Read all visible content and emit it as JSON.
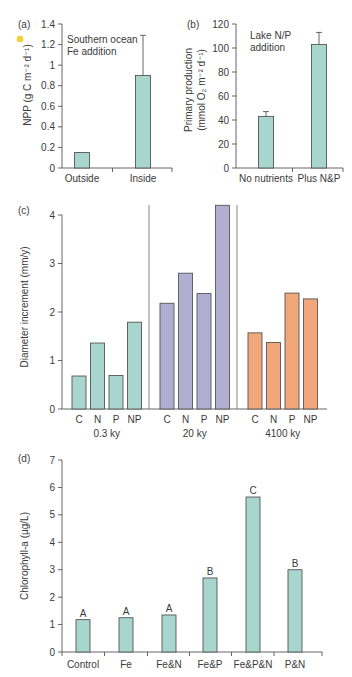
{
  "chart_data": [
    {
      "panel": "(a)",
      "type": "bar",
      "annotation": [
        "Southern ocean",
        "Fe addition"
      ],
      "ylabel": "NPP (g C m⁻² d⁻¹)",
      "xlabel": "",
      "ylim": [
        0,
        1.4
      ],
      "yticks": [
        0,
        0.2,
        0.4,
        0.6,
        0.8,
        1,
        1.2,
        1.4
      ],
      "ytick_labels": [
        "0",
        "0.2",
        "0.4",
        "0.6",
        "0.8",
        "1",
        "1.2",
        "1.4"
      ],
      "categories": [
        "Outside",
        "Inside"
      ],
      "values": [
        0.15,
        0.9
      ],
      "error_upper": [
        null,
        1.29
      ],
      "color": "#a8d5ce"
    },
    {
      "panel": "(b)",
      "type": "bar",
      "annotation": [
        "Lake N/P",
        "addition"
      ],
      "ylabel": [
        "Primary production",
        "(mmol O₂ m⁻² d⁻¹)"
      ],
      "xlabel": "",
      "ylim": [
        0,
        120
      ],
      "yticks": [
        0,
        20,
        40,
        60,
        80,
        100,
        120
      ],
      "ytick_labels": [
        "0",
        "20",
        "40",
        "60",
        "80",
        "100",
        "120"
      ],
      "categories": [
        "No nutrients",
        "Plus N&P"
      ],
      "values": [
        43,
        103
      ],
      "error_upper": [
        47,
        113
      ],
      "color": "#a8d5ce"
    },
    {
      "panel": "(c)",
      "type": "bar",
      "ylabel": "Diameter increment (mm/y)",
      "xlabel": "",
      "ylim": [
        0,
        4
      ],
      "yticks": [
        0,
        1,
        2,
        3,
        4
      ],
      "ytick_labels": [
        "0",
        "1",
        "2",
        "3",
        "4"
      ],
      "groups": [
        {
          "name": "0.3 ky",
          "categories": [
            "C",
            "N",
            "P",
            "NP"
          ],
          "values": [
            0.68,
            1.36,
            0.69,
            1.79
          ],
          "color": "#a8d5ce"
        },
        {
          "name": "20 ky",
          "categories": [
            "C",
            "N",
            "P",
            "NP"
          ],
          "values": [
            2.18,
            2.8,
            2.38,
            4.2
          ],
          "color": "#b1aed2"
        },
        {
          "name": "4100 ky",
          "categories": [
            "C",
            "N",
            "P",
            "NP"
          ],
          "values": [
            1.57,
            1.37,
            2.39,
            2.27
          ],
          "color": "#f1a77a"
        }
      ]
    },
    {
      "panel": "(d)",
      "type": "bar",
      "ylabel": "Chlorophyll-a (µg/L)",
      "xlabel": "",
      "ylim": [
        0,
        7
      ],
      "yticks": [
        0,
        1,
        2,
        3,
        4,
        5,
        6,
        7
      ],
      "ytick_labels": [
        "0",
        "1",
        "2",
        "3",
        "4",
        "5",
        "6",
        "7"
      ],
      "categories": [
        "Control",
        "Fe",
        "Fe&N",
        "Fe&P",
        "Fe&P&N",
        "P&N"
      ],
      "values": [
        1.18,
        1.25,
        1.35,
        2.7,
        5.65,
        3.0
      ],
      "significance_labels": [
        "A",
        "A",
        "A",
        "B",
        "C",
        "B"
      ],
      "color": "#a8d5ce"
    }
  ]
}
